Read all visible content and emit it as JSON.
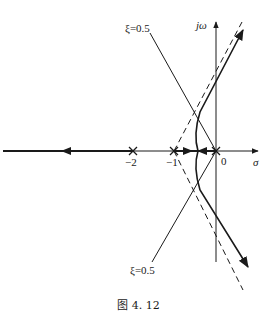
{
  "figure": {
    "caption": "图 4. 12",
    "type": "root-locus"
  },
  "axes": {
    "real_label": "σ",
    "imag_label": "jω",
    "origin_label": "0"
  },
  "poles": [
    {
      "label": "−2",
      "value": -2
    },
    {
      "label": "−1",
      "value": -1
    },
    {
      "label": "",
      "value": 0
    }
  ],
  "damping_lines": {
    "upper_label": "ξ=0.5",
    "lower_label": "ξ=0.5"
  },
  "style": {
    "stroke": "#1a1a1a",
    "background": "#ffffff"
  }
}
